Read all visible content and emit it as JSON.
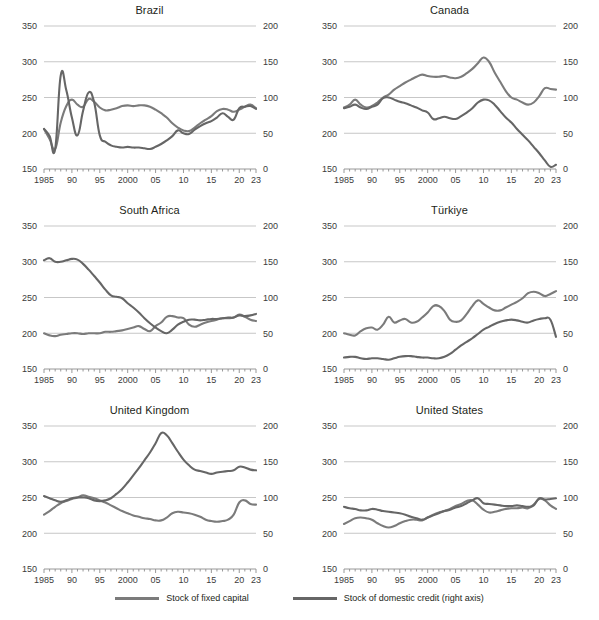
{
  "legend": {
    "items": [
      {
        "label": "Stock of fixed capital",
        "color": "#7b7b7b",
        "name": "legend-fixed-capital"
      },
      {
        "label": "Stock of domestic credit (right axis)",
        "color": "#666666",
        "name": "legend-domestic-credit"
      }
    ]
  },
  "axes": {
    "left_ticks": [
      "150",
      "200",
      "250",
      "300",
      "350"
    ],
    "right_ticks": [
      "0",
      "50",
      "100",
      "150",
      "200"
    ],
    "x_ticks": [
      "1985",
      "90",
      "95",
      "2000",
      "05",
      "10",
      "15",
      "20",
      "23"
    ]
  },
  "chart_data": {
    "type": "line",
    "title": "",
    "xlabel": "",
    "ylabel": "",
    "grid": true,
    "legend_position": "bottom",
    "x": [
      1985,
      1986,
      1987,
      1988,
      1989,
      1990,
      1991,
      1992,
      1993,
      1994,
      1995,
      1996,
      1997,
      1998,
      1999,
      2000,
      2001,
      2002,
      2003,
      2004,
      2005,
      2006,
      2007,
      2008,
      2009,
      2010,
      2011,
      2012,
      2013,
      2014,
      2015,
      2016,
      2017,
      2018,
      2019,
      2020,
      2021,
      2022,
      2023
    ],
    "x_tick_labels": [
      "1985",
      "90",
      "95",
      "2000",
      "05",
      "10",
      "15",
      "20",
      "23"
    ],
    "x_tick_values": [
      1985,
      1990,
      1995,
      2000,
      2005,
      2010,
      2015,
      2020,
      2023
    ],
    "left_axis": {
      "label": "Stock of fixed capital",
      "ylim": [
        150,
        350
      ],
      "ticks": [
        150,
        200,
        250,
        300,
        350
      ]
    },
    "right_axis": {
      "label": "Stock of domestic credit (right axis)",
      "ylim": [
        0,
        200
      ],
      "ticks": [
        0,
        50,
        100,
        150,
        200
      ]
    },
    "panels": [
      {
        "title": "Brazil",
        "series": [
          {
            "name": "Stock of fixed capital",
            "axis": "left",
            "values": [
              206,
              192,
              178,
              215,
              238,
              247,
              240,
              237,
              248,
              244,
              236,
              232,
              233,
              235,
              238,
              239,
              238,
              239,
              239,
              237,
              233,
              228,
              222,
              214,
              208,
              204,
              203,
              208,
              214,
              219,
              224,
              231,
              234,
              233,
              230,
              233,
              237,
              240,
              235
            ]
          },
          {
            "name": "Stock of domestic credit (right axis)",
            "axis": "right",
            "values": [
              56,
              46,
              28,
              131,
              110,
              72,
              47,
              81,
              107,
              93,
              47,
              38,
              33,
              31,
              30,
              31,
              30,
              30,
              29,
              28,
              31,
              35,
              40,
              46,
              54,
              50,
              49,
              55,
              60,
              64,
              67,
              72,
              78,
              73,
              69,
              85,
              87,
              88,
              84
            ]
          }
        ]
      },
      {
        "title": "Canada",
        "series": [
          {
            "name": "Stock of fixed capital",
            "axis": "left",
            "values": [
              236,
              240,
              247,
              240,
              236,
              238,
              243,
              250,
              254,
              261,
              266,
              271,
              275,
              279,
              282,
              280,
              279,
              279,
              280,
              278,
              277,
              279,
              284,
              290,
              298,
              306,
              300,
              285,
              272,
              259,
              250,
              247,
              243,
              240,
              243,
              252,
              263,
              262,
              261,
              266,
              282,
              278,
              266
            ]
          },
          {
            "name": "Stock of domestic credit (right axis)",
            "axis": "right",
            "values": [
              85,
              87,
              90,
              86,
              84,
              87,
              90,
              99,
              100,
              97,
              94,
              92,
              89,
              86,
              82,
              79,
              70,
              71,
              73,
              71,
              70,
              74,
              79,
              85,
              93,
              97,
              96,
              90,
              81,
              72,
              65,
              56,
              48,
              40,
              31,
              22,
              12,
              3,
              6,
              35
            ]
          }
        ]
      },
      {
        "title": "South Africa",
        "series": [
          {
            "name": "Stock of fixed capital",
            "axis": "left",
            "values": [
              200,
              197,
              196,
              198,
              199,
              200,
              200,
              199,
              200,
              200,
              200,
              202,
              202,
              203,
              204,
              206,
              208,
              210,
              206,
              203,
              210,
              215,
              223,
              224,
              222,
              221,
              212,
              209,
              212,
              215,
              217,
              219,
              221,
              221,
              222,
              226,
              223,
              219,
              217
            ]
          },
          {
            "name": "Stock of domestic credit (right axis)",
            "axis": "right",
            "values": [
              152,
              155,
              150,
              150,
              152,
              154,
              153,
              147,
              139,
              130,
              121,
              111,
              103,
              101,
              99,
              92,
              86,
              79,
              71,
              64,
              58,
              53,
              50,
              55,
              62,
              66,
              69,
              69,
              68,
              69,
              70,
              70,
              71,
              72,
              72,
              75,
              74,
              75,
              77
            ]
          }
        ]
      },
      {
        "title": "Türkiye",
        "series": [
          {
            "name": "Stock of fixed capital",
            "axis": "left",
            "values": [
              200,
              198,
              197,
              203,
              207,
              208,
              205,
              212,
              223,
              215,
              218,
              220,
              215,
              216,
              222,
              229,
              238,
              238,
              231,
              219,
              216,
              218,
              227,
              238,
              246,
              241,
              236,
              232,
              232,
              236,
              240,
              244,
              249,
              256,
              258,
              256,
              252,
              255,
              259
            ]
          },
          {
            "name": "Stock of domestic credit (right axis)",
            "axis": "right",
            "values": [
              16,
              17,
              17,
              15,
              14,
              15,
              15,
              14,
              13,
              15,
              17,
              18,
              18,
              17,
              16,
              16,
              15,
              15,
              17,
              21,
              27,
              33,
              38,
              43,
              49,
              55,
              59,
              63,
              66,
              68,
              69,
              68,
              66,
              65,
              68,
              70,
              71,
              69,
              45
            ]
          }
        ]
      },
      {
        "title": "United Kingdom",
        "series": [
          {
            "name": "Stock of fixed capital",
            "axis": "left",
            "values": [
              226,
              231,
              237,
              242,
              245,
              248,
              250,
              253,
              251,
              249,
              246,
              243,
              239,
              235,
              231,
              228,
              225,
              223,
              221,
              220,
              218,
              218,
              222,
              228,
              230,
              229,
              228,
              226,
              223,
              219,
              217,
              216,
              217,
              219,
              226,
              243,
              246,
              241,
              240
            ]
          },
          {
            "name": "Stock of domestic credit (right axis)",
            "axis": "right",
            "values": [
              102,
              99,
              96,
              94,
              96,
              99,
              100,
              100,
              99,
              96,
              95,
              96,
              99,
              105,
              112,
              121,
              131,
              141,
              152,
              163,
              176,
              190,
              187,
              176,
              164,
              153,
              145,
              139,
              137,
              135,
              133,
              135,
              136,
              137,
              138,
              143,
              142,
              139,
              138
            ]
          }
        ]
      },
      {
        "title": "United States",
        "series": [
          {
            "name": "Stock of fixed capital",
            "axis": "left",
            "values": [
              213,
              217,
              221,
              222,
              221,
              219,
              214,
              210,
              208,
              210,
              214,
              217,
              219,
              219,
              218,
              222,
              226,
              229,
              231,
              234,
              238,
              241,
              245,
              246,
              240,
              233,
              229,
              230,
              232,
              234,
              235,
              235,
              236,
              235,
              240,
              248,
              246,
              239,
              234
            ]
          },
          {
            "name": "Stock of domestic credit (right axis)",
            "axis": "right",
            "values": [
              87,
              85,
              84,
              82,
              82,
              84,
              83,
              81,
              80,
              79,
              78,
              76,
              73,
              71,
              69,
              72,
              75,
              78,
              81,
              83,
              86,
              88,
              92,
              96,
              99,
              92,
              91,
              90,
              89,
              88,
              88,
              89,
              88,
              87,
              89,
              99,
              97,
              98,
              99
            ]
          }
        ]
      }
    ]
  }
}
